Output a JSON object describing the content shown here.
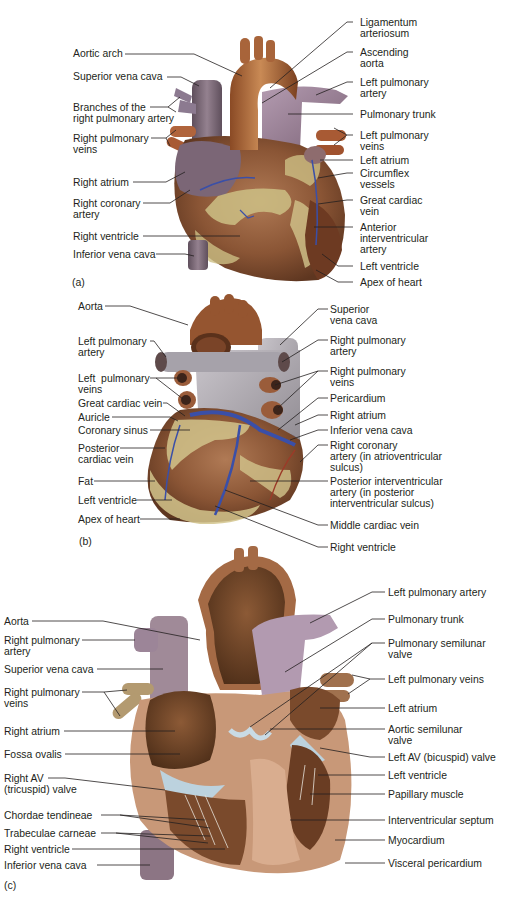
{
  "figure": {
    "colors": {
      "aorta": "#9b5a33",
      "aorta_light": "#c07a45",
      "pulmonary": "#9a8095",
      "vena_cava": "#7a6a78",
      "myocardium": "#8a5535",
      "fat": "#cfc28a",
      "vein_blue": "#3a4fa8",
      "pericardium_grey": "#a9a4aa",
      "valve": "#b9cfdc",
      "inner_chamber": "#6b4226",
      "septum_pink": "#d4a586",
      "leader_line": "#231f20"
    },
    "panels": [
      {
        "id": "a",
        "tag": "(a)",
        "left_labels": [
          [
            "Aortic arch"
          ],
          [
            "Superior vena cava"
          ],
          [
            "Branches of the",
            "right pulmonary artery"
          ],
          [
            "Right pulmonary",
            "veins"
          ],
          [
            "Right atrium"
          ],
          [
            "Right coronary",
            "artery"
          ],
          [
            "Right ventricle"
          ],
          [
            "Inferior vena cava"
          ]
        ],
        "right_labels": [
          [
            "Ligamentum",
            "arteriosum"
          ],
          [
            "Ascending",
            "aorta"
          ],
          [
            "Left pulmonary",
            "artery"
          ],
          [
            "Pulmonary trunk"
          ],
          [
            "Left pulmonary",
            "veins"
          ],
          [
            "Left atrium"
          ],
          [
            "Circumflex",
            "vessels"
          ],
          [
            "Great cardiac",
            "vein"
          ],
          [
            "Anterior",
            "interventricular",
            "artery"
          ],
          [
            "Left ventricle"
          ],
          [
            "Apex of heart"
          ]
        ]
      },
      {
        "id": "b",
        "tag": "(b)",
        "left_labels": [
          [
            "Aorta"
          ],
          [
            "Left pulmonary",
            "artery"
          ],
          [
            "Left  pulmonary",
            "veins"
          ],
          [
            "Great cardiac vein"
          ],
          [
            "Auricle"
          ],
          [
            "Coronary sinus"
          ],
          [
            "Posterior",
            "cardiac vein"
          ],
          [
            "Fat"
          ],
          [
            "Left ventricle"
          ],
          [
            "Apex of heart"
          ]
        ],
        "right_labels": [
          [
            "Superior",
            "vena cava"
          ],
          [
            "Right pulmonary",
            "artery"
          ],
          [
            "Right pulmonary",
            "veins"
          ],
          [
            "Pericardium"
          ],
          [
            "Right atrium"
          ],
          [
            "Inferior vena cava"
          ],
          [
            "Right coronary",
            "artery (in atrioventricular",
            "sulcus)"
          ],
          [
            "Posterior interventricular",
            "artery (in posterior",
            "interventricular sulcus)"
          ],
          [
            "Middle cardiac vein"
          ],
          [
            "Right ventricle"
          ]
        ]
      },
      {
        "id": "c",
        "tag": "(c)",
        "left_labels": [
          [
            "Aorta"
          ],
          [
            "Right pulmonary",
            "artery"
          ],
          [
            "Superior vena cava"
          ],
          [
            "Right pulmonary",
            "veins"
          ],
          [
            "Right atrium"
          ],
          [
            "Fossa ovalis"
          ],
          [
            "Right AV",
            "(tricuspid) valve"
          ],
          [
            "Chordae tendineae"
          ],
          [
            "Trabeculae carneae"
          ],
          [
            "Right ventricle"
          ],
          [
            "Inferior vena cava"
          ]
        ],
        "right_labels": [
          [
            "Left pulmonary artery"
          ],
          [
            "Pulmonary trunk"
          ],
          [
            "Pulmonary semilunar",
            "valve"
          ],
          [
            "Left pulmonary veins"
          ],
          [
            "Left atrium"
          ],
          [
            "Aortic semilunar",
            "valve"
          ],
          [
            "Left AV (bicuspid) valve"
          ],
          [
            "Left ventricle"
          ],
          [
            "Papillary muscle"
          ],
          [
            "Interventricular septum"
          ],
          [
            "Myocardium"
          ],
          [
            "Visceral pericardium"
          ]
        ]
      }
    ]
  }
}
